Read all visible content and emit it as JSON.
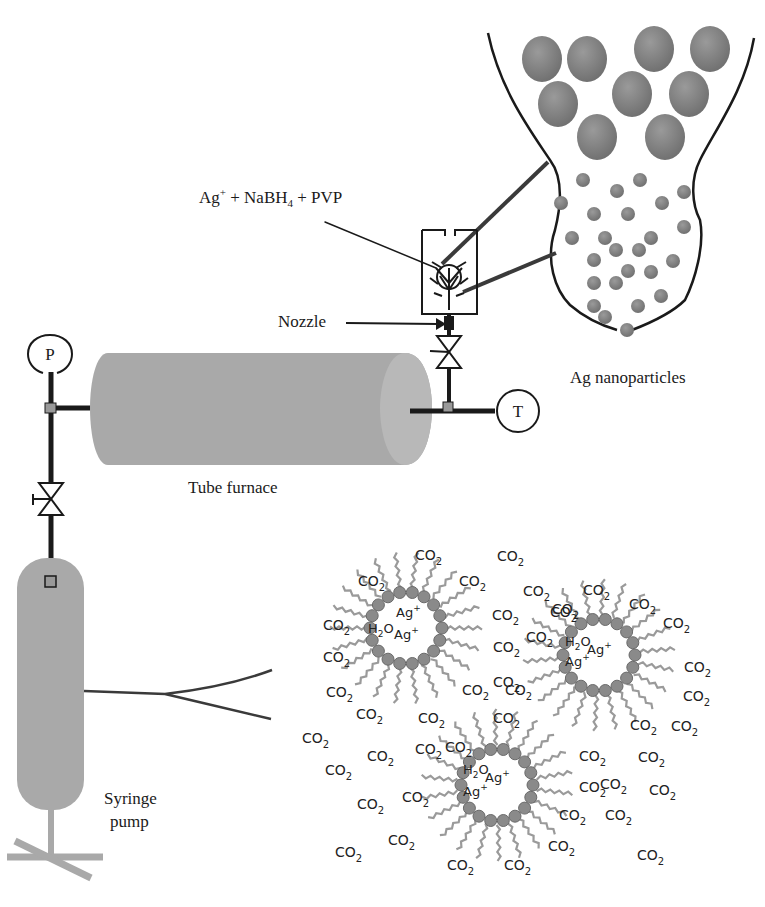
{
  "labels": {
    "reagents": {
      "base1": "Ag",
      "sup1": "+",
      "mid": " + NaBH",
      "sub": "4",
      "end": " + PVP"
    },
    "nozzle": "Nozzle",
    "nanoparticles": "Ag nanoparticles",
    "tube_furnace": "Tube furnace",
    "syringe_pump_line1": "Syringe",
    "syringe_pump_line2": "pump",
    "pressure_gauge": "P",
    "temperature_gauge": "T"
  },
  "micelle": {
    "water": {
      "base": "H",
      "sub": "2",
      "end": "O"
    },
    "silver_ion": {
      "base": "Ag",
      "sup": "+"
    },
    "co2": {
      "base": "CO",
      "sub": "2"
    }
  },
  "micelles": [
    {
      "cx": 406,
      "cy": 628,
      "r": 36
    },
    {
      "cx": 599,
      "cy": 655,
      "r": 36
    },
    {
      "cx": 497,
      "cy": 785,
      "r": 36
    }
  ],
  "co2_labels": [
    {
      "x": 415,
      "y": 548
    },
    {
      "x": 358,
      "y": 574
    },
    {
      "x": 459,
      "y": 574
    },
    {
      "x": 497,
      "y": 549
    },
    {
      "x": 523,
      "y": 584
    },
    {
      "x": 550,
      "y": 605
    },
    {
      "x": 323,
      "y": 618
    },
    {
      "x": 323,
      "y": 650
    },
    {
      "x": 492,
      "y": 608
    },
    {
      "x": 493,
      "y": 640
    },
    {
      "x": 526,
      "y": 630
    },
    {
      "x": 326,
      "y": 685
    },
    {
      "x": 356,
      "y": 707
    },
    {
      "x": 462,
      "y": 683
    },
    {
      "x": 493,
      "y": 675
    },
    {
      "x": 418,
      "y": 711
    },
    {
      "x": 493,
      "y": 711
    },
    {
      "x": 302,
      "y": 731
    },
    {
      "x": 325,
      "y": 763
    },
    {
      "x": 367,
      "y": 749
    },
    {
      "x": 415,
      "y": 742
    },
    {
      "x": 402,
      "y": 790
    },
    {
      "x": 357,
      "y": 797
    },
    {
      "x": 388,
      "y": 833
    },
    {
      "x": 335,
      "y": 845
    },
    {
      "x": 447,
      "y": 858
    },
    {
      "x": 504,
      "y": 858
    },
    {
      "x": 445,
      "y": 740
    },
    {
      "x": 583,
      "y": 583
    },
    {
      "x": 629,
      "y": 597
    },
    {
      "x": 663,
      "y": 616
    },
    {
      "x": 552,
      "y": 602
    },
    {
      "x": 684,
      "y": 660
    },
    {
      "x": 683,
      "y": 689
    },
    {
      "x": 671,
      "y": 719
    },
    {
      "x": 630,
      "y": 718
    },
    {
      "x": 638,
      "y": 750
    },
    {
      "x": 579,
      "y": 749
    },
    {
      "x": 600,
      "y": 777
    },
    {
      "x": 559,
      "y": 808
    },
    {
      "x": 605,
      "y": 808
    },
    {
      "x": 649,
      "y": 783
    },
    {
      "x": 548,
      "y": 839
    },
    {
      "x": 637,
      "y": 848
    },
    {
      "x": 505,
      "y": 683
    },
    {
      "x": 579,
      "y": 780
    }
  ],
  "colors": {
    "equipment_fill": "#a3a3a3",
    "particle_fill": "#8a8a8a",
    "line": "#1a1a1a",
    "connector": "#9a9a9a"
  }
}
